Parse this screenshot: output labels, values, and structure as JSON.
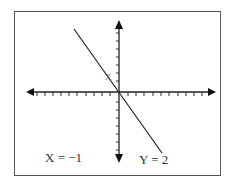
{
  "diagram": {
    "type": "coordinate-plane-graph",
    "labels": {
      "x_equation": "X = −1",
      "y_equation": "Y = 2",
      "line_point_label": "X"
    },
    "axes": {
      "origin_px": [
        119,
        92
      ],
      "x_ticks_each_side": 10,
      "y_ticks_each_side": 10,
      "arrows": [
        "left",
        "right",
        "up",
        "down"
      ]
    },
    "line": {
      "slope_direction": "negative",
      "from_px": [
        74,
        29
      ],
      "to_px": [
        162,
        153
      ]
    },
    "colors": {
      "stroke": "#222222",
      "frame": "#555555",
      "background": "#ffffff"
    }
  }
}
